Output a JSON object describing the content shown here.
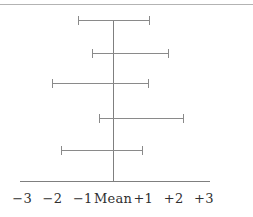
{
  "figure": {
    "background": "#ffffff",
    "top_rule_color": "#b3b3b3",
    "line_color": "#8a8a8a",
    "text_color": "#2f2f2f"
  },
  "chart_data": {
    "type": "errorbar",
    "orientation": "horizontal",
    "title": "",
    "xlabel": "",
    "ylabel": "",
    "grid": false,
    "legend": "none",
    "xlim": [
      -3.1,
      3.3
    ],
    "center_reference_value": 0,
    "center_reference_label": "Mean",
    "tick_values": [
      -3,
      -2,
      -1,
      0,
      1,
      2,
      3
    ],
    "tick_labels": [
      "−3",
      "−2",
      "−1",
      "Mean",
      "+1",
      "+2",
      "+3"
    ],
    "intervals": [
      {
        "row": 1,
        "low": -1.15,
        "high": 1.2
      },
      {
        "row": 2,
        "low": -0.7,
        "high": 1.8
      },
      {
        "row": 3,
        "low": -2.0,
        "high": 1.15
      },
      {
        "row": 4,
        "low": -0.45,
        "high": 2.3
      },
      {
        "row": 5,
        "low": -1.7,
        "high": 0.95
      }
    ]
  }
}
